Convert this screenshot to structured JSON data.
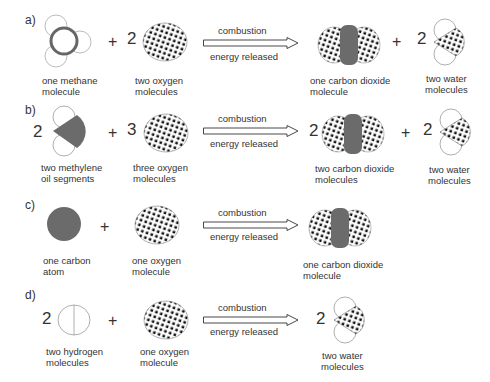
{
  "colors": {
    "carbon": "#6b6b6b",
    "outline": "#999999",
    "dots": "#111111"
  },
  "arrow": {
    "top_label": "combustion",
    "bottom_label": "energy released"
  },
  "reactions": [
    {
      "label": "a)",
      "reactant1": {
        "coef": "",
        "caption1": "one methane",
        "caption2": "molecule"
      },
      "reactant2": {
        "coef": "2",
        "caption1": "two oxygen",
        "caption2": "molecules"
      },
      "product1": {
        "coef": "",
        "caption1": "one carbon dioxide",
        "caption2": "molecule"
      },
      "product2": {
        "coef": "2",
        "caption1": "two water",
        "caption2": "molecules"
      }
    },
    {
      "label": "b)",
      "reactant1": {
        "coef": "2",
        "caption1": "two methylene",
        "caption2": "oil segments"
      },
      "reactant2": {
        "coef": "3",
        "caption1": "three oxygen",
        "caption2": "molecules"
      },
      "product1": {
        "coef": "2",
        "caption1": "two carbon dioxide",
        "caption2": "molecules"
      },
      "product2": {
        "coef": "2",
        "caption1": "two water",
        "caption2": "molecules"
      }
    },
    {
      "label": "c)",
      "reactant1": {
        "coef": "",
        "caption1": "one carbon",
        "caption2": "atom"
      },
      "reactant2": {
        "coef": "",
        "caption1": "one oxygen",
        "caption2": "molecule"
      },
      "product1": {
        "coef": "",
        "caption1": "one carbon dioxide",
        "caption2": "molecule"
      }
    },
    {
      "label": "d)",
      "reactant1": {
        "coef": "2",
        "caption1": "two hydrogen",
        "caption2": "molecules"
      },
      "reactant2": {
        "coef": "",
        "caption1": "one oxygen",
        "caption2": "molecule"
      },
      "product1": {
        "coef": "2",
        "caption1": "two water",
        "caption2": "molecules"
      }
    }
  ],
  "plus_sign": "+"
}
